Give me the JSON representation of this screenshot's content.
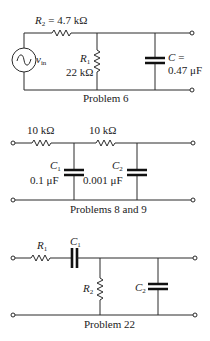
{
  "circuits": [
    {
      "caption": "Problem 6",
      "source": {
        "symbol": "v",
        "subscript": "in"
      },
      "series_resistor": {
        "symbol": "R",
        "subscript": "2",
        "equals": "= 4.7 kΩ"
      },
      "shunt_resistor": {
        "symbol": "R",
        "subscript": "1",
        "value": "22 kΩ"
      },
      "capacitor": {
        "symbol": "C",
        "equals": "=",
        "value": "0.47 μF"
      }
    },
    {
      "caption": "Problems 8 and 9",
      "resistor_1": {
        "value": "10 kΩ"
      },
      "resistor_2": {
        "value": "10 kΩ"
      },
      "capacitor_1": {
        "symbol": "C",
        "subscript": "1",
        "value": "0.1 μF"
      },
      "capacitor_2": {
        "symbol": "C",
        "subscript": "2",
        "value": "0.001 μF"
      }
    },
    {
      "caption": "Problem 22",
      "resistor_1": {
        "symbol": "R",
        "subscript": "1"
      },
      "capacitor_1": {
        "symbol": "C",
        "subscript": "1"
      },
      "resistor_2": {
        "symbol": "R",
        "subscript": "2"
      },
      "capacitor_2": {
        "symbol": "C",
        "subscript": "2"
      }
    }
  ]
}
